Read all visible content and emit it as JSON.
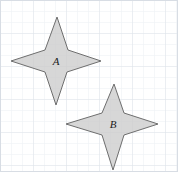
{
  "figure": {
    "name": "two-four-pointed-stars-on-grid",
    "width": 178,
    "height": 172,
    "background_color": "#ffffff"
  },
  "grid": {
    "minor_spacing": 11,
    "major_spacing": 33,
    "minor_color": "#eceff3",
    "major_color": "#dfe4ea",
    "border_color": "#d8dde4",
    "visible": true
  },
  "shapes": [
    {
      "id": "star-a",
      "label": "A",
      "type": "4-point-star",
      "fill": "#cccccc",
      "stroke": "#6e6e6e",
      "stroke_width": 1,
      "center": {
        "x": 56,
        "y": 61
      },
      "outer_points": {
        "top": {
          "x": 57,
          "y": 17
        },
        "right": {
          "x": 101,
          "y": 61
        },
        "bottom": {
          "x": 56,
          "y": 105
        },
        "left": {
          "x": 11,
          "y": 61
        }
      },
      "inner_points": {
        "top_right": {
          "x": 68,
          "y": 50
        },
        "bottom_right": {
          "x": 67,
          "y": 72
        },
        "bottom_left": {
          "x": 45,
          "y": 72
        },
        "top_left": {
          "x": 45,
          "y": 50
        }
      },
      "label_position": {
        "x": 56,
        "y": 62
      },
      "polygon_points": "57,17 68,50 101,61 67,72 56,105 45,72 11,61 45,50"
    },
    {
      "id": "star-b",
      "label": "B",
      "type": "4-point-star",
      "fill": "#cccccc",
      "stroke": "#6e6e6e",
      "stroke_width": 1,
      "center": {
        "x": 113,
        "y": 124
      },
      "outer_points": {
        "top": {
          "x": 114,
          "y": 84
        },
        "right": {
          "x": 158,
          "y": 124
        },
        "bottom": {
          "x": 113,
          "y": 170
        },
        "left": {
          "x": 66,
          "y": 124
        }
      },
      "inner_points": {
        "top_right": {
          "x": 124,
          "y": 113
        },
        "bottom_right": {
          "x": 124,
          "y": 135
        },
        "bottom_left": {
          "x": 102,
          "y": 135
        },
        "top_left": {
          "x": 102,
          "y": 113
        }
      },
      "label_position": {
        "x": 113,
        "y": 125
      },
      "polygon_points": "114,84 124,113 158,124 124,135 113,170 102,135 66,124 102,113"
    }
  ]
}
